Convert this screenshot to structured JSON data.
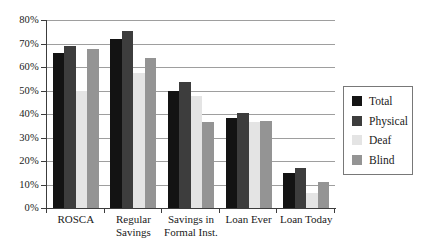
{
  "chart_data": {
    "type": "bar",
    "title": "",
    "xlabel": "",
    "ylabel": "",
    "categories": [
      "ROSCA",
      "Regular Savings",
      "Savings in Formal Inst.",
      "Loan Ever",
      "Loan Today"
    ],
    "category_label_lines": [
      [
        "ROSCA"
      ],
      [
        "Regular",
        "Savings"
      ],
      [
        "Savings in",
        "Formal Inst."
      ],
      [
        "Loan Ever"
      ],
      [
        "Loan Today"
      ]
    ],
    "series": [
      {
        "name": "Total",
        "color": "#131313",
        "values": [
          66,
          72,
          50,
          38.5,
          15
        ]
      },
      {
        "name": "Physical",
        "color": "#3d3d3d",
        "values": [
          69,
          75.5,
          53.5,
          40.5,
          17
        ]
      },
      {
        "name": "Deaf",
        "color": "#e4e4e4",
        "values": [
          50,
          57.5,
          47.5,
          36.5,
          6.5
        ]
      },
      {
        "name": "Blind",
        "color": "#949494",
        "values": [
          67.5,
          64,
          36.5,
          37,
          11
        ]
      }
    ],
    "ylim": [
      0,
      80
    ],
    "ytick_step": 10,
    "ytick_labels": [
      "0%",
      "10%",
      "20%",
      "30%",
      "40%",
      "50%",
      "60%",
      "70%",
      "80%"
    ],
    "grid": true,
    "legend_position": "right",
    "legend_entries": [
      "Total",
      "Physical",
      "Deaf",
      "Blind"
    ]
  },
  "style": {
    "grid_color": "#9e9e9e",
    "axis_color": "#3c3c3c",
    "tick_color": "#3c3c3c",
    "text_color": "#1a1a1a",
    "background": "#ffffff"
  }
}
